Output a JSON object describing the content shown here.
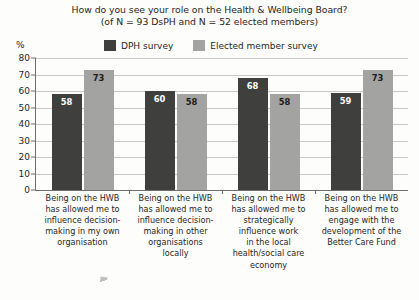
{
  "chart_data": {
    "type": "bar",
    "title": "How do you see your role on the Health & Wellbeing Board? (of N = 93 DsPH and N = 52 elected members)",
    "title_lines": [
      "How do you see your role on the Health & Wellbeing Board?",
      "(of N = 93 DsPH and N = 52 elected members)"
    ],
    "xlabel": "",
    "ylabel": "%",
    "ylim": [
      0,
      80
    ],
    "yticks": [
      0,
      10,
      20,
      30,
      40,
      50,
      60,
      70,
      80
    ],
    "grid": true,
    "legend_position": "top",
    "categories": [
      "Being on the HWB has allowed me to influence decision-making in my own organisation",
      "Being on the HWB has allowed me to influence decision-making in other organisations locally",
      "Being on the HWB has allowed me to strategically influence work in the local health/social care economy",
      "Being on the HWB has allowed me to engage with the development of the Better Care Fund"
    ],
    "category_lines": [
      [
        "Being on the HWB",
        "has allowed me to",
        "influence decision-",
        "making in my own",
        "organisation"
      ],
      [
        "Being on the HWB",
        "has allowed me to",
        "influence decision-",
        "making in other",
        "organisations",
        "locally"
      ],
      [
        "Being on the HWB",
        "has allowed me to",
        "strategically",
        "influence work",
        "in the local",
        "health/social care",
        "economy"
      ],
      [
        "Being on the HWB",
        "has allowed me to",
        "engage with the",
        "development of the",
        "Better Care Fund"
      ]
    ],
    "series": [
      {
        "name": "DPH survey",
        "color": "#3f3f3e",
        "values": [
          58,
          60,
          68,
          59
        ]
      },
      {
        "name": "Elected member survey",
        "color": "#a3a3a1",
        "values": [
          73,
          58,
          58,
          73
        ]
      }
    ]
  }
}
